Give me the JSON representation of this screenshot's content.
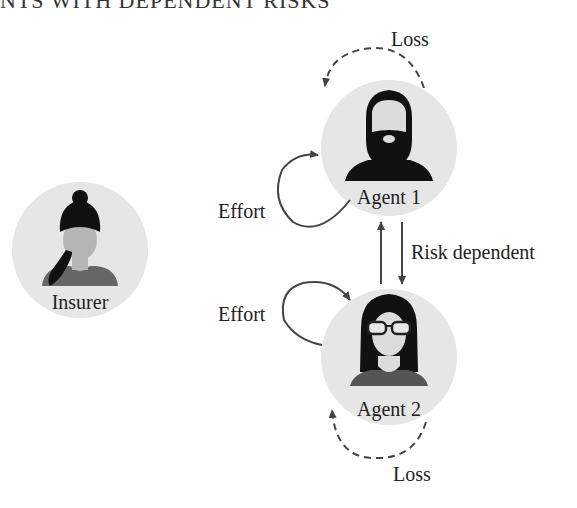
{
  "header": {
    "title_partial": "NTS WITH DEPENDENT RISKS"
  },
  "nodes": {
    "insurer": {
      "label": "Insurer",
      "icon": "woman-ponytail-avatar"
    },
    "agent1": {
      "label": "Agent 1",
      "icon": "bearded-man-avatar"
    },
    "agent2": {
      "label": "Agent 2",
      "icon": "woman-glasses-avatar"
    }
  },
  "edges": {
    "agent1_loss": "Loss",
    "agent1_effort": "Effort",
    "agent2_effort": "Effort",
    "agent2_loss": "Loss",
    "dependency": "Risk dependent"
  },
  "colors": {
    "circle_fill": "#e6e6e6",
    "arrow": "#444444",
    "icon_dark": "#111111",
    "icon_skin": "#dcdcdc",
    "shirt_gray": "#666666"
  }
}
